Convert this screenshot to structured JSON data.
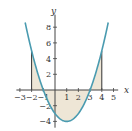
{
  "chart_data": {
    "type": "line",
    "title": "",
    "function": "y = x^2 - 2x - 3",
    "coefficients": {
      "a": 1,
      "b": -2,
      "c": -3
    },
    "xlabel": "x",
    "ylabel": "y",
    "xlim": [
      -3.3,
      5.4
    ],
    "ylim": [
      -4.8,
      9.6
    ],
    "curve_domain": [
      -2.55,
      4.55
    ],
    "x_ticks": [
      -3,
      -2,
      -1,
      1,
      2,
      3,
      4,
      5
    ],
    "x_tick_labels": [
      "−3",
      "−2",
      "−1",
      "1",
      "2",
      "3",
      "4",
      "5"
    ],
    "y_ticks": [
      8,
      6,
      4,
      2,
      -2,
      -4
    ],
    "y_tick_labels": [
      "8",
      "6",
      "4",
      "2",
      "−2",
      "−4"
    ],
    "shaded_region": {
      "from": -2,
      "to": 4,
      "between": "curve and x-axis"
    },
    "boundary_lines": [
      {
        "x": -2,
        "y": 5
      },
      {
        "x": 4,
        "y": 5
      }
    ],
    "grid": false,
    "colors": {
      "curve": "#4a9bb0",
      "fill": "#eee6d6",
      "axis": "#444444"
    }
  }
}
